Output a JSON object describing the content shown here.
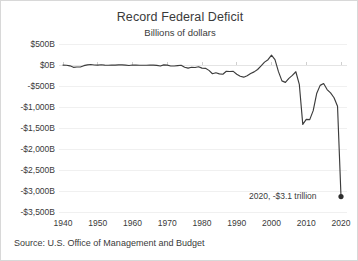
{
  "chart_data": {
    "type": "line",
    "title": "Record Federal Deficit",
    "subtitle": "Billions of dollars",
    "xlabel": "",
    "ylabel": "",
    "xlim": [
      1940,
      2020
    ],
    "ylim": [
      -3500,
      500
    ],
    "grid": true,
    "legend": false,
    "y_tick_labels": [
      "$500B",
      "$0B",
      "-$500B",
      "-$1,000B",
      "-$1,500B",
      "-$2,000B",
      "-$2,500B",
      "-$3,000B",
      "-$3,500B"
    ],
    "y_tick_values": [
      500,
      0,
      -500,
      -1000,
      -1500,
      -2000,
      -2500,
      -3000,
      -3500
    ],
    "x_tick_labels": [
      "1940",
      "1950",
      "1960",
      "1970",
      "1980",
      "1990",
      "2000",
      "2010",
      "2020"
    ],
    "x_tick_values": [
      1940,
      1950,
      1960,
      1970,
      1980,
      1990,
      2000,
      2010,
      2020
    ],
    "series_name": "Federal surplus or deficit",
    "x": [
      1940,
      1941,
      1942,
      1943,
      1944,
      1945,
      1946,
      1947,
      1948,
      1949,
      1950,
      1951,
      1952,
      1953,
      1954,
      1955,
      1956,
      1957,
      1958,
      1959,
      1960,
      1961,
      1962,
      1963,
      1964,
      1965,
      1966,
      1967,
      1968,
      1969,
      1970,
      1971,
      1972,
      1973,
      1974,
      1975,
      1976,
      1977,
      1978,
      1979,
      1980,
      1981,
      1982,
      1983,
      1984,
      1985,
      1986,
      1987,
      1988,
      1989,
      1990,
      1991,
      1992,
      1993,
      1994,
      1995,
      1996,
      1997,
      1998,
      1999,
      2000,
      2001,
      2002,
      2003,
      2004,
      2005,
      2006,
      2007,
      2008,
      2009,
      2010,
      2011,
      2012,
      2013,
      2014,
      2015,
      2016,
      2017,
      2018,
      2019,
      2020
    ],
    "values": [
      -3,
      -5,
      -20,
      -55,
      -48,
      -48,
      -16,
      4,
      12,
      1,
      -3,
      6,
      -2,
      -6,
      -1,
      -3,
      4,
      3,
      -3,
      -13,
      0,
      -3,
      -7,
      -5,
      -6,
      -1,
      -4,
      -9,
      -25,
      3,
      -3,
      -23,
      -23,
      -15,
      -6,
      -53,
      -74,
      -54,
      -59,
      -41,
      -74,
      -79,
      -128,
      -208,
      -185,
      -212,
      -221,
      -150,
      -155,
      -153,
      -221,
      -269,
      -290,
      -255,
      -203,
      -164,
      -107,
      -22,
      69,
      126,
      236,
      128,
      -158,
      -378,
      -413,
      -318,
      -248,
      -161,
      -459,
      -1413,
      -1294,
      -1300,
      -1087,
      -680,
      -485,
      -442,
      -585,
      -665,
      -779,
      -984,
      -3132
    ],
    "annotations": [
      {
        "text": "2020, -$3.1 trillion",
        "x": 2020,
        "y": -3132,
        "marker": true
      }
    ],
    "source": "Source: U.S. Office of Management and Budget"
  },
  "colors": {
    "line": "#3c3c3c",
    "text": "#3a3a3a",
    "grid": "#f0f0f0",
    "background": "#ffffff",
    "border": "#d8d8d8"
  }
}
